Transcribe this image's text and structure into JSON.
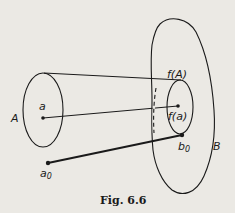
{
  "figure": {
    "caption": "Fig. 6.6",
    "labels": {
      "set_A": "A",
      "set_B": "B",
      "point_a": "a",
      "point_a0": "a",
      "point_a0_sub": "0",
      "image_fA": "f(A)",
      "image_fa": "f(a)",
      "point_b0": "b",
      "point_b0_sub": "0"
    },
    "colors": {
      "ink": "#1a1a1a",
      "paper": "#ebe9e4"
    }
  }
}
